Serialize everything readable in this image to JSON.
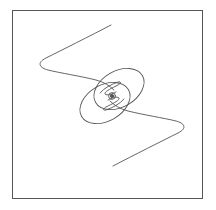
{
  "figure": {
    "stroke_color": "#555555",
    "background": "#ffffff"
  }
}
